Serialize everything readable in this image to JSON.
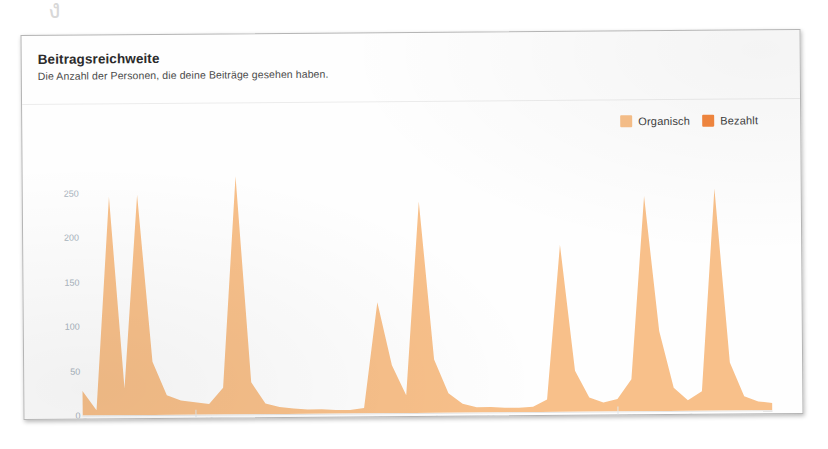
{
  "artifact": {
    "glyph": "ง"
  },
  "card": {
    "title": "Beitragsreichweite",
    "subtitle": "Die Anzahl der Personen, die deine Beiträge gesehen haben."
  },
  "legend": {
    "items": [
      {
        "label": "Organisch",
        "color": "#f8c08a"
      },
      {
        "label": "Bezahlt",
        "color": "#f3873f"
      }
    ]
  },
  "chart_data": {
    "type": "area",
    "title": "Beitragsreichweite",
    "subtitle": "Die Anzahl der Personen, die deine Beiträge gesehen haben.",
    "xlabel": "",
    "ylabel": "",
    "ylim": [
      0,
      270
    ],
    "yticks": [
      0,
      50,
      100,
      150,
      200,
      250
    ],
    "ytick_labels": [
      "0",
      "50",
      "100",
      "150",
      "200",
      "250"
    ],
    "grid": false,
    "legend_position": "top-right",
    "xtick_labels": [
      "25",
      "27",
      "29",
      "31",
      "03",
      "05",
      "07",
      "09",
      "11",
      "13",
      "15",
      "17",
      "19",
      "21",
      "23",
      "25",
      "27",
      "29",
      "03",
      "05",
      "07",
      "09",
      "11",
      "13"
    ],
    "month_labels": [
      {
        "label": "JUN",
        "at_x": "03"
      },
      {
        "label": "JUL",
        "at_x": "03"
      }
    ],
    "x": [
      "25",
      "26",
      "27",
      "28",
      "29",
      "30",
      "31",
      "01",
      "02",
      "03",
      "04",
      "05",
      "06",
      "07",
      "08",
      "09",
      "10",
      "11",
      "12",
      "13",
      "14",
      "15",
      "16",
      "17",
      "18",
      "19",
      "20",
      "21",
      "22",
      "23",
      "24",
      "25",
      "26",
      "27",
      "28",
      "29",
      "30",
      "01",
      "02",
      "03",
      "04",
      "05",
      "06",
      "07",
      "08",
      "09",
      "10",
      "11",
      "12",
      "13"
    ],
    "series": [
      {
        "name": "Organisch",
        "color": "#f8c08a",
        "values": [
          28,
          6,
          246,
          30,
          248,
          60,
          22,
          16,
          14,
          12,
          30,
          268,
          36,
          12,
          8,
          6,
          5,
          5,
          4,
          4,
          6,
          125,
          54,
          20,
          238,
          60,
          22,
          10,
          6,
          6,
          5,
          5,
          6,
          14,
          188,
          46,
          16,
          10,
          14,
          36,
          242,
          90,
          26,
          12,
          22,
          250,
          54,
          16,
          10,
          8
        ]
      },
      {
        "name": "Bezahlt",
        "color": "#f3873f",
        "values": [
          0,
          0,
          0,
          0,
          0,
          0,
          0,
          0,
          0,
          0,
          0,
          0,
          0,
          0,
          0,
          0,
          0,
          0,
          0,
          0,
          0,
          0,
          0,
          0,
          0,
          0,
          0,
          0,
          0,
          0,
          0,
          0,
          0,
          0,
          0,
          0,
          0,
          0,
          0,
          0,
          0,
          0,
          0,
          0,
          0,
          0,
          0,
          0,
          0,
          0
        ]
      }
    ]
  }
}
